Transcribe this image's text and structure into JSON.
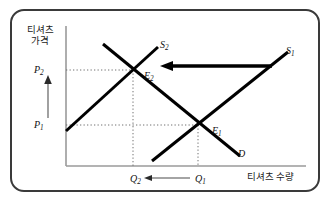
{
  "figure": {
    "kind": "supply-demand-diagram",
    "axes": {
      "y_title": "티셔츠\n가격",
      "x_title": "티셔츠 수량",
      "axis_color": "#9a9a9a"
    },
    "price_ticks": [
      {
        "id": "p2",
        "label": "P",
        "sub": "2",
        "y_value": 70
      },
      {
        "id": "p1",
        "label": "P",
        "sub": "1",
        "y_value": 125
      }
    ],
    "quantity_ticks": [
      {
        "id": "q2",
        "label": "Q",
        "sub": "2",
        "x_value": 133
      },
      {
        "id": "q1",
        "label": "Q",
        "sub": "1",
        "x_value": 198
      }
    ],
    "equilibria": [
      {
        "id": "e2",
        "label": "E",
        "sub": "2",
        "x": 133,
        "y": 70
      },
      {
        "id": "e1",
        "label": "E",
        "sub": "1",
        "x": 198,
        "y": 125
      }
    ],
    "curves": [
      {
        "id": "s1",
        "label": "S",
        "sub": "1",
        "type": "supply",
        "x1": 152,
        "y1": 161,
        "x2": 288,
        "y2": 52
      },
      {
        "id": "s2",
        "label": "S",
        "sub": "2",
        "type": "supply",
        "x1": 66,
        "y1": 131,
        "x2": 158,
        "y2": 47
      },
      {
        "id": "d",
        "label": "D",
        "sub": "",
        "type": "demand",
        "x1": 103,
        "y1": 44,
        "x2": 240,
        "y2": 156
      }
    ],
    "annotations": [
      {
        "id": "supply-shift-arrow",
        "direction": "left",
        "from_x": 272,
        "to_x": 163,
        "y": 66
      },
      {
        "id": "price-rise-arrow",
        "direction": "up",
        "x": 48,
        "from_y": 118,
        "to_y": 76
      },
      {
        "id": "quantity-fall-arrow",
        "direction": "left",
        "from_x": 190,
        "to_x": 147,
        "y": 178
      }
    ],
    "colors": {
      "curve": "#000000",
      "frame": "#3a3a3a",
      "guide": "#707070",
      "background": "#ffffff"
    }
  }
}
